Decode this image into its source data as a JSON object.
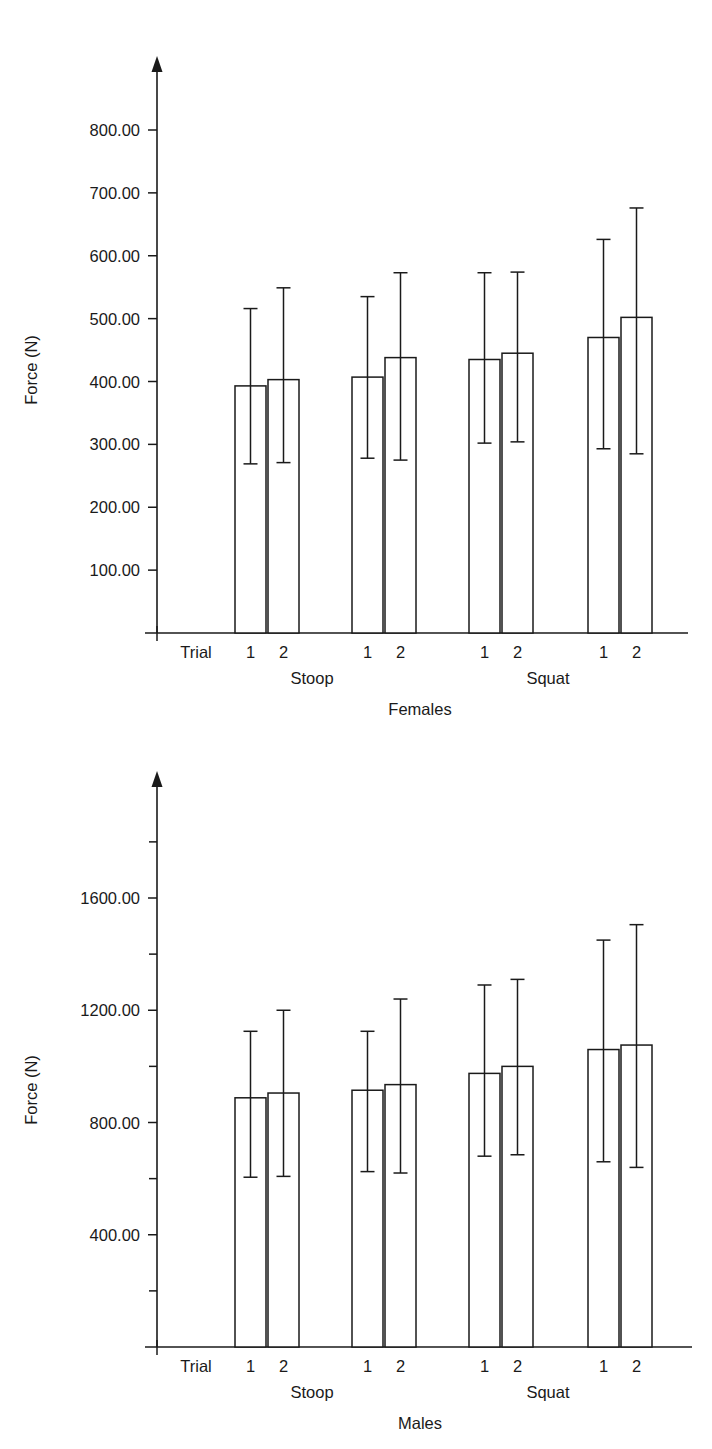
{
  "figure": {
    "panels": [
      "females",
      "males"
    ]
  },
  "chart_data": [
    {
      "type": "bar",
      "title": "",
      "panel_label": "Females",
      "xlabel": "Females",
      "ylabel": "Force (N)",
      "trial_axis_label": "Trial",
      "ylim": [
        0,
        880
      ],
      "ytick_labels": [
        "100.00",
        "200.00",
        "300.00",
        "400.00",
        "500.00",
        "600.00",
        "700.00",
        "800.00"
      ],
      "ytick_values": [
        100,
        200,
        300,
        400,
        500,
        600,
        700,
        800
      ],
      "grid": false,
      "legend": "none",
      "group_labels": [
        "Stoop",
        "Squat"
      ],
      "categories": [
        "1",
        "2",
        "1",
        "2",
        "1",
        "2",
        "1",
        "2"
      ],
      "values": [
        393,
        403,
        407,
        438,
        435,
        445,
        470,
        502
      ],
      "error_upper": [
        516,
        549,
        535,
        573,
        573,
        574,
        626,
        676
      ],
      "error_lower": [
        269,
        271,
        278,
        275,
        302,
        304,
        293,
        285
      ],
      "errorbars": "min-max whiskers"
    },
    {
      "type": "bar",
      "title": "",
      "panel_label": "Males",
      "xlabel": "Males",
      "ylabel": "Force (N)",
      "trial_axis_label": "Trial",
      "ylim": [
        0,
        1840
      ],
      "ytick_labels": [
        "400.00",
        "800.00",
        "1200.00",
        "1600.00"
      ],
      "ytick_values": [
        400,
        800,
        1200,
        1600
      ],
      "yminor_values": [
        200,
        600,
        1000,
        1400,
        1800
      ],
      "grid": false,
      "legend": "none",
      "group_labels": [
        "Stoop",
        "Squat"
      ],
      "categories": [
        "1",
        "2",
        "1",
        "2",
        "1",
        "2",
        "1",
        "2"
      ],
      "values": [
        888,
        905,
        915,
        935,
        975,
        1000,
        1060,
        1076
      ],
      "error_upper": [
        1125,
        1200,
        1125,
        1240,
        1290,
        1310,
        1450,
        1505
      ],
      "error_lower": [
        605,
        608,
        625,
        620,
        680,
        685,
        660,
        640
      ],
      "errorbars": "min-max whiskers"
    }
  ]
}
